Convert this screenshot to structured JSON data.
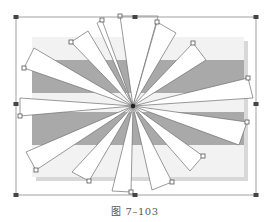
{
  "figure": {
    "caption": "图 7–103",
    "center": [
      133,
      106
    ],
    "bounding_box": {
      "x1": 16,
      "y1": 17,
      "x2": 256,
      "y2": 195,
      "stroke": "#8a8a8a"
    },
    "handles": [
      [
        16,
        17
      ],
      [
        135,
        17
      ],
      [
        256,
        17
      ],
      [
        16,
        104
      ],
      [
        256,
        104
      ],
      [
        16,
        195
      ],
      [
        135,
        195
      ],
      [
        256,
        195
      ]
    ],
    "background_panel": {
      "x": 32,
      "y": 37,
      "w": 212,
      "h": 140,
      "fill": "#f2f2f2",
      "shadow": "#d8d8d8"
    },
    "stripes": [
      {
        "x": 32,
        "y": 60,
        "w": 212,
        "h": 33,
        "fill": "#a9a9a9"
      },
      {
        "x": 32,
        "y": 112,
        "w": 212,
        "h": 33,
        "fill": "#a9a9a9"
      }
    ],
    "blades": [
      {
        "tip_a": [
          120,
          16
        ],
        "tip_b": [
          158,
          16
        ],
        "handle": [
          120,
          16
        ]
      },
      {
        "tip_a": [
          157,
          22
        ],
        "tip_b": [
          176,
          33
        ],
        "handle": [
          157,
          22
        ]
      },
      {
        "tip_a": [
          193,
          43
        ],
        "tip_b": [
          206,
          60
        ],
        "handle": [
          193,
          43
        ]
      },
      {
        "tip_a": [
          248,
          78
        ],
        "tip_b": [
          253,
          98
        ],
        "handle": [
          248,
          78
        ]
      },
      {
        "tip_a": [
          247,
          122
        ],
        "tip_b": [
          239,
          145
        ],
        "handle": [
          247,
          122
        ]
      },
      {
        "tip_a": [
          203,
          156
        ],
        "tip_b": [
          190,
          171
        ],
        "handle": [
          203,
          156
        ]
      },
      {
        "tip_a": [
          172,
          182
        ],
        "tip_b": [
          152,
          190
        ],
        "handle": [
          172,
          182
        ]
      },
      {
        "tip_a": [
          131,
          192
        ],
        "tip_b": [
          112,
          191
        ],
        "handle": [
          131,
          192
        ]
      },
      {
        "tip_a": [
          89,
          181
        ],
        "tip_b": [
          72,
          172
        ],
        "handle": [
          89,
          181
        ]
      },
      {
        "tip_a": [
          36,
          170
        ],
        "tip_b": [
          26,
          152
        ],
        "handle": [
          36,
          170
        ]
      },
      {
        "tip_a": [
          20,
          116
        ],
        "tip_b": [
          20,
          98
        ],
        "handle": [
          20,
          116
        ]
      },
      {
        "tip_a": [
          24,
          68
        ],
        "tip_b": [
          34,
          48
        ],
        "handle": [
          24,
          68
        ]
      },
      {
        "tip_a": [
          71,
          42
        ],
        "tip_b": [
          88,
          31
        ],
        "handle": [
          71,
          42
        ]
      },
      {
        "tip_a": [
          97,
          23
        ],
        "tip_b": [
          102,
          20
        ],
        "handle": [
          102,
          20
        ]
      }
    ],
    "colors": {
      "blade_fill": "#ffffff",
      "blade_stroke": "#6e6e6e",
      "handle_fill": "#ffffff",
      "handle_stroke": "#555555",
      "box_handle_fill": "#444444",
      "center_dot": "#222222"
    }
  }
}
